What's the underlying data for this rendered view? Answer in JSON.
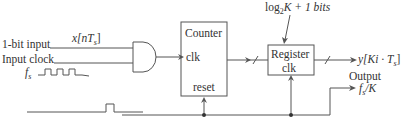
{
  "inputs": {
    "data_label": "1-bit input",
    "data_signal": "x[nT",
    "data_signal_sub": "s",
    "data_signal_close": "]",
    "clock_label": "Input clock",
    "clock_freq": "f",
    "clock_freq_sub": "s"
  },
  "counter": {
    "title": "Counter",
    "clk": "clk",
    "reset": "reset"
  },
  "register": {
    "title": "Register",
    "clk": "clk",
    "width_label_pre": "log",
    "width_label_sub": "2",
    "width_label_post": "K + 1 bits"
  },
  "output": {
    "signal": "y[Ki · T",
    "signal_sub": "s",
    "signal_close": "]",
    "label": "Output",
    "freq": "f",
    "freq_sub": "s",
    "freq_post": "/K"
  }
}
